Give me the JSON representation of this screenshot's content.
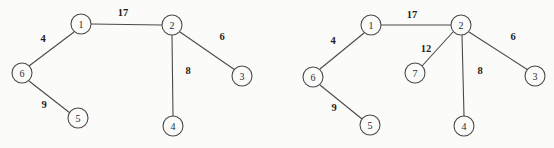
{
  "figure": {
    "background_color": "#fbfbfa",
    "stroke_color": "#4a4a4a",
    "label_color": "#1d1d1d",
    "node_radius": 10
  },
  "graphs": [
    {
      "id": "left-graph",
      "name": "graph-before",
      "nodes": [
        {
          "id": "n1",
          "label": "1",
          "cx": 81,
          "cy": 24
        },
        {
          "id": "n2",
          "label": "2",
          "cx": 172,
          "cy": 25
        },
        {
          "id": "n3",
          "label": "3",
          "cx": 242,
          "cy": 76
        },
        {
          "id": "n4",
          "label": "4",
          "cx": 173,
          "cy": 126
        },
        {
          "id": "n5",
          "label": "5",
          "cx": 78,
          "cy": 118
        },
        {
          "id": "n6",
          "label": "6",
          "cx": 22,
          "cy": 73
        }
      ],
      "edges": [
        {
          "from": "1",
          "to": "2",
          "weight": "17",
          "x1": 91,
          "y1": 24,
          "x2": 162,
          "y2": 25,
          "lx": 123,
          "ly": 12
        },
        {
          "from": "1",
          "to": "6",
          "weight": "4",
          "x1": 74,
          "y1": 32,
          "x2": 29,
          "y2": 66,
          "lx": 43,
          "ly": 38
        },
        {
          "from": "6",
          "to": "5",
          "weight": "9",
          "x1": 29,
          "y1": 81,
          "x2": 70,
          "y2": 113,
          "lx": 44,
          "ly": 104
        },
        {
          "from": "2",
          "to": "3",
          "weight": "6",
          "x1": 180,
          "y1": 32,
          "x2": 235,
          "y2": 70,
          "lx": 222,
          "ly": 36
        },
        {
          "from": "2",
          "to": "4",
          "weight": "8",
          "x1": 172,
          "y1": 35,
          "x2": 173,
          "y2": 116,
          "lx": 188,
          "ly": 70
        }
      ]
    },
    {
      "id": "right-graph",
      "name": "graph-after",
      "nodes": [
        {
          "id": "m1",
          "label": "1",
          "cx": 371,
          "cy": 25
        },
        {
          "id": "m2",
          "label": "2",
          "cx": 461,
          "cy": 25
        },
        {
          "id": "m3",
          "label": "3",
          "cx": 535,
          "cy": 76
        },
        {
          "id": "m4",
          "label": "4",
          "cx": 464,
          "cy": 126
        },
        {
          "id": "m5",
          "label": "5",
          "cx": 370,
          "cy": 125
        },
        {
          "id": "m6",
          "label": "6",
          "cx": 313,
          "cy": 77
        },
        {
          "id": "m7",
          "label": "7",
          "cx": 415,
          "cy": 73
        }
      ],
      "edges": [
        {
          "from": "1",
          "to": "2",
          "weight": "17",
          "x1": 381,
          "y1": 25,
          "x2": 451,
          "y2": 25,
          "lx": 412,
          "ly": 14
        },
        {
          "from": "1",
          "to": "6",
          "weight": "4",
          "x1": 364,
          "y1": 33,
          "x2": 320,
          "y2": 69,
          "lx": 333,
          "ly": 40
        },
        {
          "from": "6",
          "to": "5",
          "weight": "9",
          "x1": 320,
          "y1": 85,
          "x2": 362,
          "y2": 119,
          "lx": 334,
          "ly": 107
        },
        {
          "from": "2",
          "to": "3",
          "weight": "6",
          "x1": 469,
          "y1": 32,
          "x2": 528,
          "y2": 70,
          "lx": 513,
          "ly": 36
        },
        {
          "from": "2",
          "to": "4",
          "weight": "8",
          "x1": 462,
          "y1": 35,
          "x2": 464,
          "y2": 116,
          "lx": 480,
          "ly": 70
        },
        {
          "from": "2",
          "to": "7",
          "weight": "12",
          "x1": 453,
          "y1": 32,
          "x2": 422,
          "y2": 66,
          "lx": 426,
          "ly": 48
        }
      ]
    }
  ]
}
